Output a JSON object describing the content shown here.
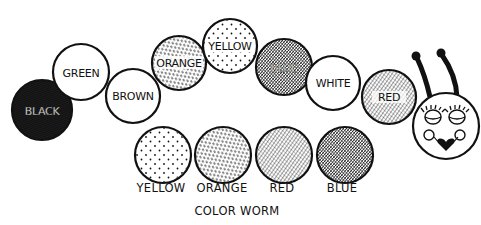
{
  "title": "COLOR WORM",
  "colors": {
    "ink": "#111111",
    "paper": "#ffffff"
  },
  "worm": {
    "segments": [
      {
        "label": "BLACK",
        "pattern": "solid-dark"
      },
      {
        "label": "GREEN",
        "pattern": "blank"
      },
      {
        "label": "BROWN",
        "pattern": "blank"
      },
      {
        "label": "ORANGE",
        "pattern": "dashes"
      },
      {
        "label": "YELLOW",
        "pattern": "dots"
      },
      {
        "label": "BLUE",
        "pattern": "dense-hatch"
      },
      {
        "label": "WHITE",
        "pattern": "blank"
      },
      {
        "label": "RED",
        "pattern": "hatch"
      }
    ],
    "head": {
      "features": [
        "antennae",
        "eyelashes",
        "eyes",
        "cheeks",
        "heart-lips"
      ]
    }
  },
  "legend": {
    "items": [
      {
        "label": "YELLOW",
        "pattern": "dots"
      },
      {
        "label": "ORANGE",
        "pattern": "dashes"
      },
      {
        "label": "RED",
        "pattern": "hatch"
      },
      {
        "label": "BLUE",
        "pattern": "dense-hatch"
      }
    ]
  }
}
